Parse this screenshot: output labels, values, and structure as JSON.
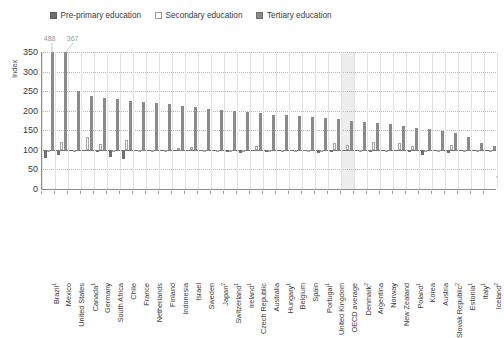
{
  "chart_data": {
    "type": "bar",
    "title": "",
    "subtitle": "",
    "xlabel": "",
    "ylabel": "Index",
    "ylim": [
      0,
      350
    ],
    "yticks": [
      0,
      50,
      100,
      150,
      200,
      250,
      300,
      350
    ],
    "baseline": 100,
    "grid": true,
    "legend_position": "top-left",
    "legend": [
      {
        "name": "Pre-primary education",
        "color": "#6f6f6f",
        "style": "filled"
      },
      {
        "name": "Secondary education",
        "color": "#ffffff",
        "style": "outlined"
      },
      {
        "name": "Tertiary education",
        "color": "#8b8b8b",
        "style": "filled"
      }
    ],
    "highlight_category": "OECD average",
    "annotations": [
      {
        "text": "488",
        "category": "Brazil",
        "series": "Tertiary education",
        "value": 488
      },
      {
        "text": "367",
        "category": "Mexico",
        "series": "Tertiary education",
        "value": 367
      }
    ],
    "categories": [
      "Brazil",
      "Mexico",
      "United States",
      "Canada",
      "Germany",
      "South Africa",
      "Chile",
      "France",
      "Netherlands",
      "Finland",
      "Indonesia",
      "Israel",
      "Sweden",
      "Japan",
      "Switzerland",
      "Ireland",
      "Czech Republic",
      "Australia",
      "Hungary",
      "Belgium",
      "Spain",
      "Portugal",
      "United Kingdom",
      "OECD average",
      "Denmark",
      "Argentina",
      "Norway",
      "New Zealand",
      "Poland",
      "Korea",
      "Austria",
      "Slovak Republic",
      "Estonia",
      "Italy",
      "Iceland"
    ],
    "category_footnotes": [
      "1",
      "",
      "",
      "1",
      "",
      "",
      "",
      "",
      "",
      "",
      "",
      "",
      "",
      "2",
      "1",
      "1",
      "",
      "",
      "1",
      "",
      "",
      "1",
      "",
      "",
      "2",
      "",
      "",
      "",
      "1",
      "",
      "",
      "2",
      "1",
      "1",
      "2"
    ],
    "series": [
      {
        "name": "Pre-primary education",
        "color": "#6f6f6f",
        "values": [
          78,
          86,
          99,
          100,
          95,
          82,
          76,
          99,
          97,
          97,
          96,
          98,
          100,
          99,
          95,
          93,
          98,
          95,
          97,
          100,
          99,
          93,
          94,
          96,
          100,
          94,
          97,
          96,
          95,
          88,
          97,
          93,
          97,
          97,
          100
        ]
      },
      {
        "name": "Secondary education",
        "color": "#ffffff",
        "values": [
          100,
          119,
          100,
          132,
          114,
          100,
          124,
          100,
          100,
          100,
          105,
          107,
          100,
          100,
          100,
          100,
          109,
          100,
          100,
          100,
          100,
          100,
          118,
          113,
          100,
          120,
          100,
          118,
          110,
          100,
          100,
          113,
          100,
          100,
          100
        ]
      },
      {
        "name": "Tertiary education",
        "color": "#8b8b8b",
        "values": [
          488,
          367,
          251,
          238,
          233,
          229,
          226,
          222,
          219,
          216,
          213,
          209,
          205,
          201,
          198,
          196,
          193,
          190,
          188,
          186,
          183,
          181,
          178,
          175,
          172,
          168,
          165,
          161,
          157,
          153,
          148,
          142,
          133,
          118,
          110
        ]
      }
    ]
  }
}
